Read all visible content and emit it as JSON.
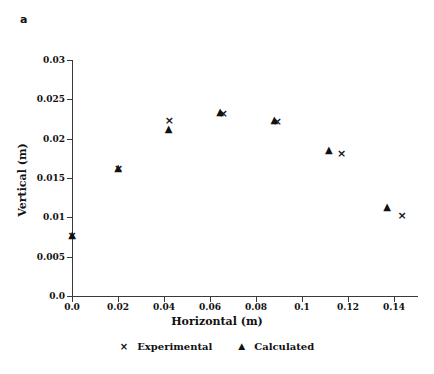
{
  "figure": {
    "panel_label": "a"
  },
  "legend_items": [
    {
      "symbol": "×",
      "symbol_name": "cross-marker",
      "label": "Experimental"
    },
    {
      "symbol": "△",
      "symbol_name": "triangle-marker",
      "label": "Calculated"
    }
  ],
  "chart_data": {
    "type": "scatter",
    "title": "",
    "subtitle": "",
    "panel_label": "a",
    "xlabel": "Horizontal (m)",
    "ylabel": "Vertical (m)",
    "xlim": [
      0.0,
      0.1504
    ],
    "ylim": [
      0.0,
      0.03
    ],
    "grid": false,
    "legend_position": "below-axes-center",
    "xticks": [
      0.0,
      0.02,
      0.04,
      0.06,
      0.08,
      0.1,
      0.12,
      0.14
    ],
    "xticklabels": [
      "0.0",
      "0.02",
      "0.04",
      "0.06",
      "0.08",
      "0.1",
      "0.12",
      "0.14"
    ],
    "yticks": [
      0.0,
      0.005,
      0.01,
      0.015,
      0.02,
      0.025,
      0.03
    ],
    "yticklabels": [
      "0.0",
      "0.005",
      "0.01",
      "0.015",
      "0.02",
      "0.025",
      "0.03"
    ],
    "series": [
      {
        "name": "Experimental",
        "marker": "x",
        "color": "#111111",
        "points": [
          {
            "x": 0.0,
            "y": 0.0078
          },
          {
            "x": 0.0203,
            "y": 0.0163
          },
          {
            "x": 0.0423,
            "y": 0.0224
          },
          {
            "x": 0.0658,
            "y": 0.0232
          },
          {
            "x": 0.0893,
            "y": 0.0223
          },
          {
            "x": 0.1172,
            "y": 0.0182
          },
          {
            "x": 0.1435,
            "y": 0.0103
          }
        ]
      },
      {
        "name": "Calculated",
        "marker": "triangle",
        "color": "#111111",
        "points": [
          {
            "x": 0.0,
            "y": 0.0078
          },
          {
            "x": 0.02,
            "y": 0.0163
          },
          {
            "x": 0.042,
            "y": 0.0212
          },
          {
            "x": 0.0644,
            "y": 0.0234
          },
          {
            "x": 0.088,
            "y": 0.0224
          },
          {
            "x": 0.1117,
            "y": 0.0185
          },
          {
            "x": 0.137,
            "y": 0.0113
          }
        ]
      }
    ]
  }
}
